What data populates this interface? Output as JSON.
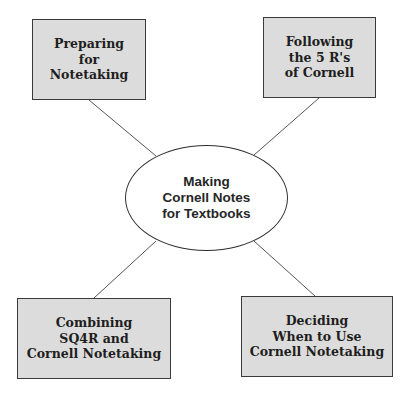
{
  "diagram": {
    "type": "concept-map",
    "colors": {
      "background": "#ffffff",
      "box_fill": "#dcdcdc",
      "box_border": "#3a3a3a",
      "connector": "#555555",
      "text": "#1e1e1e"
    },
    "center": {
      "lines": [
        "Making",
        "Cornell Notes",
        "for Textbooks"
      ]
    },
    "nodes": [
      {
        "id": "top-left",
        "lines": [
          "Preparing",
          "for",
          "Notetaking"
        ]
      },
      {
        "id": "top-right",
        "lines": [
          "Following",
          "the 5 R's",
          "of Cornell"
        ]
      },
      {
        "id": "bottom-left",
        "lines": [
          "Combining",
          "SQ4R and",
          "Cornell Notetaking"
        ]
      },
      {
        "id": "bottom-right",
        "lines": [
          "Deciding",
          "When to Use",
          "Cornell Notetaking"
        ]
      }
    ],
    "connectors": [
      {
        "from": "top-left",
        "to": "center"
      },
      {
        "from": "top-right",
        "to": "center"
      },
      {
        "from": "bottom-left",
        "to": "center"
      },
      {
        "from": "bottom-right",
        "to": "center"
      }
    ]
  }
}
